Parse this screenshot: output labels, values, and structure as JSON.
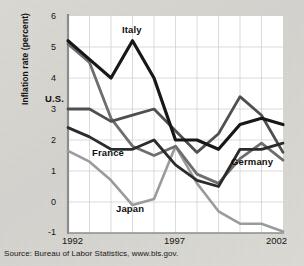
{
  "figure": {
    "source_note": "Source: Bureau of Labor Statistics, www.bls.gov.",
    "ylabel": "Inflation rate (percent)"
  },
  "axis": {
    "yticks": [
      "6",
      "5",
      "4",
      "3",
      "2",
      "1",
      "0",
      "-1"
    ],
    "xticks": [
      "1992",
      "1997",
      "2002"
    ]
  },
  "labels": {
    "italy": "Italy",
    "us": "U.S.",
    "france": "France",
    "japan": "Japan",
    "germany": "Germany"
  },
  "colors": {
    "italy": "#171717",
    "us": "#4f4f4f",
    "france": "#2b2b2b",
    "germany": "#6e6e6e",
    "japan": "#9b9b9b",
    "grid": "#c9c9c9",
    "axis": "#8a8a8a",
    "plot_bg": "#ffffff",
    "text": "#17150f"
  },
  "chart_data": {
    "type": "line",
    "title": "",
    "xlabel": "",
    "ylabel": "Inflation rate (percent)",
    "x": [
      1992,
      1993,
      1994,
      1995,
      1996,
      1997,
      1998,
      1999,
      2000,
      2001,
      2002
    ],
    "xtick_labels": [
      "1992",
      "1997",
      "2002"
    ],
    "xlim": [
      1992,
      2002
    ],
    "ylim": [
      -1,
      6
    ],
    "ytick_values": [
      6,
      5,
      4,
      3,
      2,
      1,
      0,
      -1
    ],
    "grid": true,
    "legend": "inline-annotations",
    "series": [
      {
        "name": "Italy",
        "color": "#171717",
        "values": [
          5.2,
          4.6,
          4.0,
          5.2,
          4.0,
          2.0,
          2.0,
          1.7,
          2.5,
          2.7,
          2.5
        ]
      },
      {
        "name": "U.S.",
        "color": "#4f4f4f",
        "values": [
          3.0,
          3.0,
          2.6,
          2.8,
          3.0,
          2.3,
          1.6,
          2.2,
          3.4,
          2.8,
          1.6
        ]
      },
      {
        "name": "France",
        "color": "#2b2b2b",
        "values": [
          2.4,
          2.1,
          1.7,
          1.7,
          2.0,
          1.2,
          0.7,
          0.5,
          1.7,
          1.7,
          1.9
        ]
      },
      {
        "name": "Germany",
        "color": "#6e6e6e",
        "values": [
          5.1,
          4.5,
          2.7,
          1.8,
          1.5,
          1.8,
          0.9,
          0.6,
          1.4,
          1.9,
          1.35
        ]
      },
      {
        "name": "Japan",
        "color": "#9b9b9b",
        "values": [
          1.65,
          1.3,
          0.7,
          -0.1,
          0.1,
          1.8,
          0.6,
          -0.3,
          -0.7,
          -0.7,
          -0.95
        ]
      }
    ]
  }
}
